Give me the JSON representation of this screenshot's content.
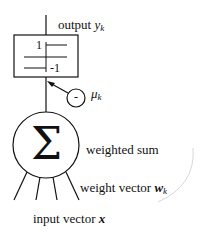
{
  "diagram": {
    "type": "perceptron-neuron",
    "labels": {
      "output": "output",
      "output_var": "y",
      "output_sub": "k",
      "threshold_var": "μ",
      "threshold_sub": "k",
      "threshold_sign": "-",
      "weighted_sum": "weighted sum",
      "weight_vector": "weight vector",
      "weight_var": "w",
      "weight_sub": "k",
      "input_vector": "input vector",
      "input_var": "x"
    },
    "activation": {
      "upper_value": "1",
      "lower_value": "-1"
    },
    "summation_symbol": "Σ",
    "input_count": 4,
    "colors": {
      "stroke": "#111111",
      "background": "#ffffff",
      "decor_arc": "#d8d8d8"
    }
  }
}
